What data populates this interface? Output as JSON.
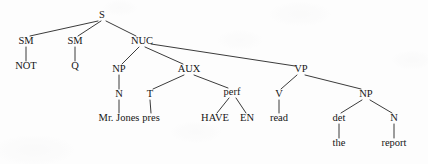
{
  "figure": {
    "kind": "constituency-syntax-tree",
    "sentence": "NOT Q Mr. Jones pres HAVE EN read the report",
    "gloss": "Hasn't Mr. Jones read the report?",
    "background_color": "#fdfdfd",
    "ink_color": "#151515",
    "edge_color": "#252525"
  },
  "nodes": {
    "s": {
      "label": "S",
      "x": 102,
      "y": 18,
      "type": "nonterminal"
    },
    "sm1": {
      "label": "SM",
      "x": 26,
      "y": 44,
      "type": "nonterminal"
    },
    "sm2": {
      "label": "SM",
      "x": 75,
      "y": 44,
      "type": "nonterminal"
    },
    "nuc": {
      "label": "NUC",
      "x": 142,
      "y": 44,
      "type": "nonterminal"
    },
    "not": {
      "label": "NOT",
      "x": 26,
      "y": 69,
      "type": "terminal"
    },
    "q": {
      "label": "Q",
      "x": 75,
      "y": 69,
      "type": "terminal"
    },
    "np1": {
      "label": "NP",
      "x": 119,
      "y": 72,
      "type": "nonterminal"
    },
    "aux": {
      "label": "AUX",
      "x": 189,
      "y": 72,
      "type": "nonterminal"
    },
    "vp": {
      "label": "VP",
      "x": 301,
      "y": 72,
      "type": "nonterminal"
    },
    "n1": {
      "label": "N",
      "x": 119,
      "y": 97,
      "type": "nonterminal"
    },
    "t": {
      "label": "T",
      "x": 150,
      "y": 97,
      "type": "nonterminal"
    },
    "perf": {
      "label": "perf",
      "x": 232,
      "y": 95,
      "type": "nonterminal"
    },
    "v": {
      "label": "V",
      "x": 279,
      "y": 97,
      "type": "nonterminal"
    },
    "np2": {
      "label": "NP",
      "x": 366,
      "y": 97,
      "type": "nonterminal"
    },
    "mrjones": {
      "label": "Mr. Jones",
      "x": 119,
      "y": 121,
      "type": "terminal"
    },
    "pres": {
      "label": "pres",
      "x": 151,
      "y": 121,
      "type": "terminal"
    },
    "have": {
      "label": "HAVE",
      "x": 215,
      "y": 121,
      "type": "terminal"
    },
    "en": {
      "label": "EN",
      "x": 247,
      "y": 121,
      "type": "terminal"
    },
    "read": {
      "label": "read",
      "x": 279,
      "y": 121,
      "type": "terminal"
    },
    "det": {
      "label": "det",
      "x": 339,
      "y": 121,
      "type": "nonterminal"
    },
    "n2": {
      "label": "N",
      "x": 394,
      "y": 121,
      "type": "nonterminal"
    },
    "the": {
      "label": "the",
      "x": 339,
      "y": 146,
      "type": "terminal"
    },
    "report": {
      "label": "report",
      "x": 394,
      "y": 146,
      "type": "terminal"
    }
  },
  "edges": [
    {
      "from": "s",
      "to": "sm1",
      "x1": 98,
      "y1": 21,
      "x2": 30,
      "y2": 36
    },
    {
      "from": "s",
      "to": "sm2",
      "x1": 101,
      "y1": 21,
      "x2": 78,
      "y2": 36
    },
    {
      "from": "s",
      "to": "nuc",
      "x1": 106,
      "y1": 21,
      "x2": 136,
      "y2": 36
    },
    {
      "from": "sm1",
      "to": "not",
      "x1": 26,
      "y1": 47,
      "x2": 26,
      "y2": 61
    },
    {
      "from": "sm2",
      "to": "q",
      "x1": 75,
      "y1": 47,
      "x2": 75,
      "y2": 61
    },
    {
      "from": "nuc",
      "to": "np1",
      "x1": 139,
      "y1": 47,
      "x2": 122,
      "y2": 64
    },
    {
      "from": "nuc",
      "to": "aux",
      "x1": 145,
      "y1": 47,
      "x2": 183,
      "y2": 64
    },
    {
      "from": "nuc",
      "to": "vp",
      "x1": 151,
      "y1": 44,
      "x2": 295,
      "y2": 66
    },
    {
      "from": "np1",
      "to": "n1",
      "x1": 119,
      "y1": 75,
      "x2": 119,
      "y2": 89
    },
    {
      "from": "aux",
      "to": "t",
      "x1": 184,
      "y1": 75,
      "x2": 153,
      "y2": 89
    },
    {
      "from": "aux",
      "to": "perf",
      "x1": 194,
      "y1": 75,
      "x2": 228,
      "y2": 88
    },
    {
      "from": "vp",
      "to": "v",
      "x1": 297,
      "y1": 75,
      "x2": 281,
      "y2": 89
    },
    {
      "from": "vp",
      "to": "np2",
      "x1": 305,
      "y1": 75,
      "x2": 361,
      "y2": 89
    },
    {
      "from": "n1",
      "to": "mrjones",
      "x1": 119,
      "y1": 100,
      "x2": 119,
      "y2": 113
    },
    {
      "from": "t",
      "to": "pres",
      "x1": 150,
      "y1": 100,
      "x2": 151,
      "y2": 113
    },
    {
      "from": "perf",
      "to": "have",
      "x1": 229,
      "y1": 98,
      "x2": 217,
      "y2": 113
    },
    {
      "from": "perf",
      "to": "en",
      "x1": 236,
      "y1": 98,
      "x2": 246,
      "y2": 113
    },
    {
      "from": "v",
      "to": "read",
      "x1": 279,
      "y1": 100,
      "x2": 279,
      "y2": 113
    },
    {
      "from": "np2",
      "to": "det",
      "x1": 362,
      "y1": 100,
      "x2": 341,
      "y2": 113
    },
    {
      "from": "np2",
      "to": "n2",
      "x1": 370,
      "y1": 100,
      "x2": 392,
      "y2": 113
    },
    {
      "from": "det",
      "to": "the",
      "x1": 339,
      "y1": 124,
      "x2": 339,
      "y2": 138
    },
    {
      "from": "n2",
      "to": "report",
      "x1": 394,
      "y1": 124,
      "x2": 394,
      "y2": 138
    }
  ]
}
